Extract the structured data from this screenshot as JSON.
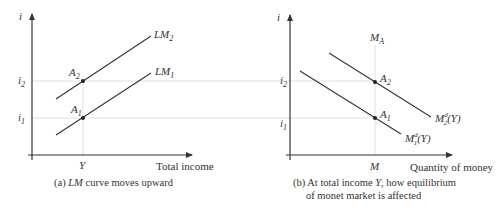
{
  "left_panel": {
    "y_axis_label": "i",
    "x_axis_label": "Total income",
    "x_tick": "Y",
    "y_ticks": {
      "i2": "i",
      "i2_sub": "2",
      "i1": "i",
      "i1_sub": "1"
    },
    "curves": [
      {
        "name": "LM",
        "sub": "2"
      },
      {
        "name": "LM",
        "sub": "1"
      }
    ],
    "points": [
      {
        "name": "A",
        "sub": "2"
      },
      {
        "name": "A",
        "sub": "1"
      }
    ],
    "caption_prefix": "(a) ",
    "caption_italic": "LM",
    "caption_suffix": " curve moves upward"
  },
  "right_panel": {
    "y_axis_label": "i",
    "x_axis_label": "Quantity of money",
    "x_tick": "M",
    "vertical_label": "M",
    "vertical_label_sub": "A",
    "y_ticks": {
      "i2": "i",
      "i2_sub": "2",
      "i1": "i",
      "i1_sub": "1"
    },
    "curves": [
      {
        "name": "M",
        "sup": "d",
        "sub": "2",
        "arg": "(Y)"
      },
      {
        "name": "M",
        "sup": "d",
        "sub": "1",
        "arg": "(Y)"
      }
    ],
    "points": [
      {
        "name": "A",
        "sub": "2"
      },
      {
        "name": "A",
        "sub": "1"
      }
    ],
    "caption_line1_prefix": "(b) At total income ",
    "caption_line1_italic": "Y",
    "caption_line1_suffix": ", how equilibrium",
    "caption_line2": "of monet market is affected"
  }
}
